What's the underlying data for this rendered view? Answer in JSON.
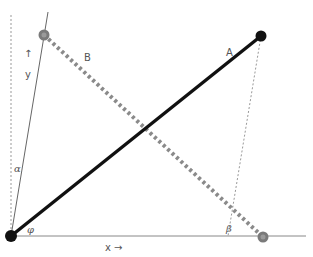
{
  "diagram": {
    "labels": {
      "vector_a": "A",
      "vector_b": "B",
      "y_axis": "y",
      "y_arrow": "↑",
      "x_axis": "x →",
      "alpha": "α",
      "phi": "φ",
      "beta": "β"
    },
    "points": {
      "origin": [
        11,
        236
      ],
      "a_end": [
        261,
        36
      ],
      "b_start": [
        44,
        35
      ],
      "b_end": [
        263,
        237
      ]
    },
    "colors": {
      "vector_a": "#111111",
      "vector_b": "#8a8a8a",
      "axis": "#777777",
      "guide": "#888888",
      "point_b": "#7a7a7a"
    }
  }
}
